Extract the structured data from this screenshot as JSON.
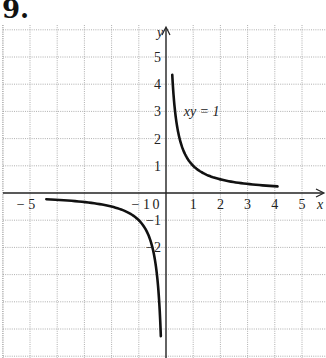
{
  "problem": {
    "number": "9."
  },
  "chart_data": {
    "type": "line",
    "title": "",
    "equation_label": "xy = 1",
    "xlabel": "x",
    "ylabel": "y",
    "xlim": [
      -6,
      5.8
    ],
    "ylim": [
      -6,
      6
    ],
    "grid": true,
    "grid_style": "dotted",
    "x_ticks": [
      {
        "value": -5,
        "label": "− 5"
      },
      {
        "value": -1,
        "label": "− 1"
      },
      {
        "value": 0,
        "label": "0"
      },
      {
        "value": 1,
        "label": "1"
      },
      {
        "value": 2,
        "label": "2"
      },
      {
        "value": 3,
        "label": "3"
      },
      {
        "value": 4,
        "label": "4"
      },
      {
        "value": 5,
        "label": "5"
      }
    ],
    "y_ticks": [
      {
        "value": 5,
        "label": "5"
      },
      {
        "value": 4,
        "label": "4"
      },
      {
        "value": 3,
        "label": "3"
      },
      {
        "value": 2,
        "label": "2"
      },
      {
        "value": 1,
        "label": "1"
      },
      {
        "value": -1,
        "label": "−1"
      },
      {
        "value": -2,
        "label": "−2"
      }
    ],
    "series": [
      {
        "name": "xy = 1 (x > 0 branch)",
        "x": [
          0.23,
          0.3,
          0.4,
          0.5,
          0.75,
          1,
          1.5,
          2,
          2.5,
          3,
          3.5,
          4.1
        ],
        "y": [
          4.35,
          3.33,
          2.5,
          2.0,
          1.33,
          1.0,
          0.67,
          0.5,
          0.4,
          0.33,
          0.29,
          0.24
        ]
      },
      {
        "name": "xy = 1 (x < 0 branch)",
        "x": [
          -4.4,
          -4,
          -3,
          -2,
          -1.5,
          -1,
          -0.75,
          -0.5,
          -0.4,
          -0.3,
          -0.23,
          -0.19
        ],
        "y": [
          -0.23,
          -0.25,
          -0.33,
          -0.5,
          -0.67,
          -1.0,
          -1.33,
          -2.0,
          -2.5,
          -3.33,
          -4.35,
          -5.4
        ]
      }
    ]
  }
}
